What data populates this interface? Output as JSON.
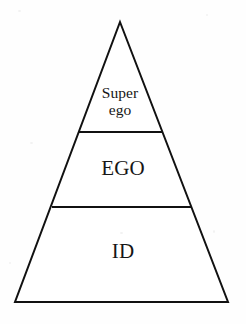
{
  "diagram": {
    "type": "pyramid",
    "background_color": "#fefefe",
    "stroke_color": "#111111",
    "text_color": "#161616",
    "geometry": {
      "apex": [
        120,
        22
      ],
      "bottom_left": [
        15,
        302
      ],
      "bottom_right": [
        228,
        302
      ],
      "stroke_width": 2,
      "divider_1": {
        "y": 132,
        "x_start": 79,
        "x_end": 163
      },
      "divider_2": {
        "y": 207,
        "x_start": 52,
        "x_end": 192
      }
    },
    "layers": [
      {
        "id": "superego",
        "label_line_1": "Super",
        "label_line_2": "ego",
        "position": "top",
        "font_size": 15.5
      },
      {
        "id": "ego",
        "label": "EGO",
        "position": "middle",
        "font_size": 21
      },
      {
        "id": "id",
        "label": "ID",
        "position": "bottom",
        "font_size": 21
      }
    ]
  }
}
